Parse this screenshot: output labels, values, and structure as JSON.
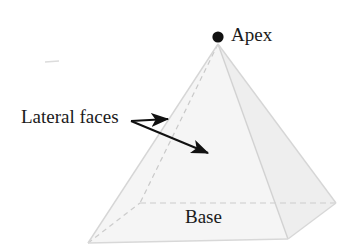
{
  "figure": {
    "background_color": "#ffffff"
  },
  "labels": {
    "apex": "Apex",
    "lateral_faces": "Lateral faces",
    "base": "Base"
  },
  "colors": {
    "text": "#1a1a1a",
    "apex_dot": "#111111",
    "arrow": "#111111",
    "face_light": "#f7f7f7",
    "face_mid": "#f2f2f2",
    "face_dark": "#ededed",
    "edge_solid": "#d8d8d8",
    "edge_hidden": "#cfcfcf",
    "faint_mark": "#d9d9d9"
  },
  "geometry": {
    "apex": [
      218,
      44
    ],
    "vertex_front_left": [
      88,
      243
    ],
    "vertex_front_right": [
      288,
      239
    ],
    "vertex_back_right": [
      336,
      203
    ],
    "vertex_back_left": [
      140,
      203
    ],
    "apex_dot_center": [
      218,
      37
    ],
    "apex_dot_radius": 5.5
  },
  "arrows": [
    {
      "name": "arrow-to-left-face",
      "from": [
        131,
        121
      ],
      "to": [
        172,
        119
      ]
    },
    {
      "name": "arrow-to-front-face",
      "from": [
        131,
        121
      ],
      "to": [
        213,
        156
      ]
    }
  ],
  "faint_mark": {
    "from": [
      45,
      62
    ],
    "to": [
      59,
      61
    ]
  }
}
